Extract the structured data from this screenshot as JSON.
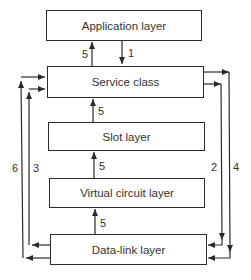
{
  "diagram": {
    "layers": [
      {
        "id": "application",
        "label": "Application layer"
      },
      {
        "id": "service",
        "label": "Service class"
      },
      {
        "id": "slot",
        "label": "Slot layer"
      },
      {
        "id": "vc",
        "label": "Virtual circuit layer"
      },
      {
        "id": "datalink",
        "label": "Data-link layer"
      }
    ],
    "arrows": [
      {
        "from": "Service class",
        "to": "Application layer",
        "label": "5"
      },
      {
        "from": "Application layer",
        "to": "Service class",
        "label": "1"
      },
      {
        "from": "Slot layer",
        "to": "Service class",
        "label": "5"
      },
      {
        "from": "Virtual circuit layer",
        "to": "Slot layer",
        "label": "5"
      },
      {
        "from": "Data-link layer",
        "to": "Virtual circuit layer",
        "label": "5"
      },
      {
        "from": "Service class",
        "to": "Data-link layer",
        "label": "2"
      },
      {
        "from": "Data-link layer",
        "to": "Service class",
        "label": "3"
      },
      {
        "from": "Service class",
        "to": "Data-link layer",
        "label": "4"
      },
      {
        "from": "Data-link layer",
        "to": "Service class",
        "label": "6"
      }
    ]
  }
}
